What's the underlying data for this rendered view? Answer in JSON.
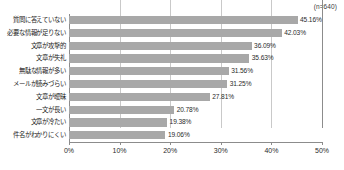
{
  "annotation": {
    "sample_size": "(n=640)"
  },
  "chart_data": {
    "type": "bar",
    "orientation": "horizontal",
    "title": "",
    "subtitle": "",
    "xlabel": "",
    "ylabel": "",
    "xlim": [
      0,
      50
    ],
    "grid": true,
    "legend": null,
    "bar_color": "#a8a8a8",
    "value_label_suffix": "%",
    "xtick_labels": [
      "0%",
      "10%",
      "20%",
      "30%",
      "40%",
      "50%"
    ],
    "xticks": [
      0,
      10,
      20,
      30,
      40,
      50
    ],
    "categories": [
      "質問に答えていない",
      "必要な情報が足りない",
      "文章が攻撃的",
      "文章が失礼",
      "無駄な情報が多い",
      "メールが読みづらい",
      "文章が曖昧",
      "一文が長い",
      "文章が冷たい",
      "件名がわかりにくい"
    ],
    "values": [
      45.16,
      42.03,
      36.09,
      35.63,
      31.56,
      31.25,
      27.81,
      20.78,
      19.38,
      19.06
    ],
    "value_labels": [
      "45.16%",
      "42.03%",
      "36.09%",
      "35.63%",
      "31.56%",
      "31.25%",
      "27.81%",
      "20.78%",
      "19.38%",
      "19.06%"
    ]
  }
}
